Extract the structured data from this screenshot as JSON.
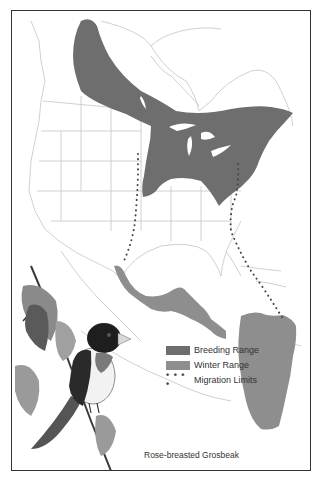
{
  "map": {
    "title": "Rose-breasted Grosbeak",
    "colors": {
      "breeding": "#6e6e6e",
      "winter": "#8e8e8e",
      "outline": "#bdbdbd",
      "frame": "#333333"
    }
  },
  "legend": {
    "items": [
      {
        "label": "Breeding Range",
        "type": "swatch",
        "color": "#6e6e6e"
      },
      {
        "label": "Winter Range",
        "type": "swatch",
        "color": "#8e8e8e"
      },
      {
        "label": "Migration Limits",
        "type": "dots",
        "symbol": "• • • •"
      }
    ]
  },
  "illustration": {
    "subject": "rose-breasted-grosbeak-on-branch"
  }
}
